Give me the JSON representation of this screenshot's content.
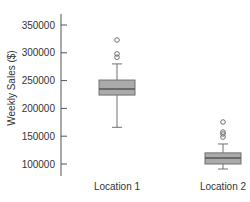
{
  "chart_data": {
    "type": "boxplot",
    "title": "",
    "xlabel": "",
    "ylabel": "Weekly Sales ($)",
    "ylim": [
      85000,
      370000
    ],
    "yticks": [
      100000,
      150000,
      200000,
      250000,
      300000,
      350000
    ],
    "ytick_labels": [
      "100000",
      "150000",
      "200000",
      "250000",
      "300000",
      "350000"
    ],
    "grid": false,
    "legend": null,
    "categories": [
      "Location 1",
      "Location 2"
    ],
    "series": [
      {
        "name": "Location 1",
        "whisker_low": 166000,
        "q1": 224000,
        "median": 235000,
        "q3": 251000,
        "whisker_high": 280000,
        "outliers": [
          292000,
          298000,
          323000
        ]
      },
      {
        "name": "Location 2",
        "whisker_low": 91000,
        "q1": 100000,
        "median": 111000,
        "q3": 120000,
        "whisker_high": 136000,
        "outliers": [
          148500,
          154000,
          157500,
          175500
        ]
      }
    ],
    "colors": {
      "box_fill": "#aaaaaa",
      "box_stroke": "#707070",
      "axis": "#555555",
      "text": "#333333"
    }
  }
}
